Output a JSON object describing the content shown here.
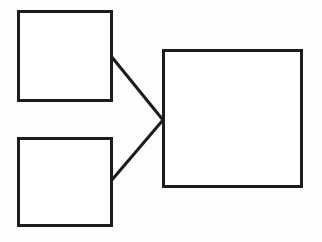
{
  "canvas": {
    "width": 322,
    "height": 242,
    "background_color": "#fdfdfd",
    "stroke_color": "#1c1c1c",
    "fill_color": "#ffffff",
    "stroke_width": 3
  },
  "diagram": {
    "type": "block-diagram",
    "nodes": [
      {
        "id": "top-left-box",
        "name": "top-left-box",
        "label": "",
        "x": 18,
        "y": 11,
        "width": 93,
        "height": 89
      },
      {
        "id": "bottom-left-box",
        "name": "bottom-left-box",
        "label": "",
        "x": 18,
        "y": 138,
        "width": 93,
        "height": 87
      },
      {
        "id": "right-box",
        "name": "right-box",
        "label": "",
        "x": 163,
        "y": 50,
        "width": 138,
        "height": 136
      }
    ],
    "connectors": [
      {
        "id": "connector-top",
        "name": "connector-top-to-right",
        "from": "top-left-box",
        "to": "right-box",
        "x1": 111,
        "y1": 56,
        "x2": 163,
        "y2": 120
      },
      {
        "id": "connector-bottom",
        "name": "connector-bottom-to-right",
        "from": "bottom-left-box",
        "to": "right-box",
        "x1": 111,
        "y1": 181,
        "x2": 163,
        "y2": 120
      }
    ]
  }
}
